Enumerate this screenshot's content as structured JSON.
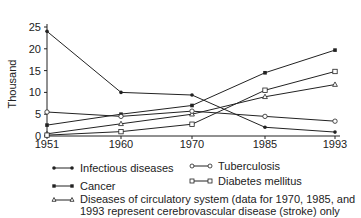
{
  "chart_data": {
    "type": "line",
    "title": "",
    "xlabel": "",
    "ylabel": "Thousand",
    "x": [
      "1951",
      "1960",
      "1970",
      "1985",
      "1993"
    ],
    "ylim": [
      0,
      25
    ],
    "yticks": [
      "0",
      "5",
      "10",
      "15",
      "20",
      "25"
    ],
    "grid": false,
    "legend_position": "bottom",
    "series": [
      {
        "name": "Infectious diseases",
        "marker": "filled-circle",
        "values": [
          24,
          10,
          9.4,
          2,
          0.9
        ]
      },
      {
        "name": "Cancer",
        "marker": "filled-square",
        "values": [
          2.5,
          5,
          7,
          14.5,
          19.7
        ]
      },
      {
        "name": "Diseases of circulatory system (data for 1970, 1985, and 1993 represent cerebrovascular disease (stroke) only",
        "marker": "open-triangle",
        "values": [
          0.5,
          2.8,
          5,
          9,
          11.8
        ]
      },
      {
        "name": "Tuberculosis",
        "marker": "open-circle",
        "values": [
          5.5,
          4.5,
          5.7,
          4.5,
          3.4
        ]
      },
      {
        "name": "Diabetes mellitus",
        "marker": "open-square",
        "values": [
          0.2,
          1,
          2.7,
          10.5,
          14.8
        ]
      }
    ]
  },
  "legend": {
    "infectious": "Infectious diseases",
    "cancer": "Cancer",
    "circulatory_line1": "Diseases of circulatory system (data for 1970, 1985, and",
    "circulatory_line2": "1993 represent cerebrovascular disease (stroke) only",
    "tuberculosis": "Tuberculosis",
    "diabetes": "Diabetes mellitus"
  }
}
